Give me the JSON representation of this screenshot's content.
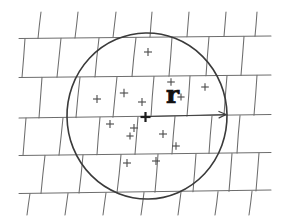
{
  "figure": {
    "canvas": {
      "width": 287,
      "height": 217,
      "background": "#ffffff"
    },
    "style": {
      "wall_stroke": "#6d6d6d",
      "wall_stroke_width": 1.05,
      "circle_stroke": "#3a3a3a",
      "circle_stroke_width": 1.6,
      "arrow_stroke": "#3f3f3f",
      "arrow_stroke_width": 1.2,
      "mark_stroke": "#4a4a4a",
      "mark_stroke_width": 1.1,
      "center_stroke": "#1c1c1c",
      "center_stroke_width": 2.2,
      "label_color": "#111111"
    },
    "radius_label": {
      "text": "r",
      "x": 166,
      "y": 103,
      "font_size": 25
    },
    "circle": {
      "cx": 147,
      "cy": 116,
      "rx": 80,
      "ry": 83,
      "rotation": -1
    },
    "center_point": {
      "x": 145.5,
      "y": 117,
      "arm": 5
    },
    "radius_arrow": {
      "x1": 150,
      "y1": 116.5,
      "x2": 226,
      "y2": 114.5,
      "head_length": 7,
      "head_spread": 3.2
    },
    "wall": {
      "left": 19,
      "right": 271,
      "courses": [
        {
          "y_left": 38.5,
          "y_right": 36.0
        },
        {
          "y_left": 77.5,
          "y_right": 75.0
        },
        {
          "y_left": 118.0,
          "y_right": 114.5
        },
        {
          "y_left": 155.5,
          "y_right": 152.5
        },
        {
          "y_left": 193.5,
          "y_right": 190.0
        }
      ],
      "top_stub_y": 12,
      "bottom_stub_y": 215,
      "joints": [
        {
          "row": 0,
          "x_top": 41,
          "x_bot": 38,
          "top": 12,
          "bottom": 38.5
        },
        {
          "row": 0,
          "x_top": 78,
          "x_bot": 75,
          "top": 12,
          "bottom": 38.0
        },
        {
          "row": 0,
          "x_top": 116,
          "x_bot": 113,
          "top": 12,
          "bottom": 37.5
        },
        {
          "row": 0,
          "x_top": 152,
          "x_bot": 150,
          "top": 12,
          "bottom": 37.0
        },
        {
          "row": 0,
          "x_top": 189,
          "x_bot": 187,
          "top": 12,
          "bottom": 36.8
        },
        {
          "row": 0,
          "x_top": 226,
          "x_bot": 224,
          "top": 12,
          "bottom": 36.4
        },
        {
          "row": 0,
          "x_top": 257,
          "x_bot": 255,
          "top": 12,
          "bottom": 36.2
        },
        {
          "row": 1,
          "x_top": 25,
          "x_bot": 22,
          "top": 38.5,
          "bottom": 77.5
        },
        {
          "row": 1,
          "x_top": 61,
          "x_bot": 57,
          "top": 38.3,
          "bottom": 77.3
        },
        {
          "row": 1,
          "x_top": 99,
          "x_bot": 95,
          "top": 38.0,
          "bottom": 77.0
        },
        {
          "row": 1,
          "x_top": 136,
          "x_bot": 132,
          "top": 37.6,
          "bottom": 76.6
        },
        {
          "row": 1,
          "x_top": 172,
          "x_bot": 169,
          "top": 37.2,
          "bottom": 76.2
        },
        {
          "row": 1,
          "x_top": 209,
          "x_bot": 206,
          "top": 36.8,
          "bottom": 75.8
        },
        {
          "row": 1,
          "x_top": 244,
          "x_bot": 241,
          "top": 36.4,
          "bottom": 75.4
        },
        {
          "row": 2,
          "x_top": 42,
          "x_bot": 39,
          "top": 77.4,
          "bottom": 118.0
        },
        {
          "row": 2,
          "x_top": 80,
          "x_bot": 76,
          "top": 77.2,
          "bottom": 117.6
        },
        {
          "row": 2,
          "x_top": 117,
          "x_bot": 113,
          "top": 76.8,
          "bottom": 117.2
        },
        {
          "row": 2,
          "x_top": 154,
          "x_bot": 151,
          "top": 76.4,
          "bottom": 116.8
        },
        {
          "row": 2,
          "x_top": 190,
          "x_bot": 187,
          "top": 76.0,
          "bottom": 116.2
        },
        {
          "row": 2,
          "x_top": 227,
          "x_bot": 224,
          "top": 75.6,
          "bottom": 115.6
        },
        {
          "row": 2,
          "x_top": 257,
          "x_bot": 254,
          "top": 75.2,
          "bottom": 115.2
        },
        {
          "row": 3,
          "x_top": 26,
          "x_bot": 23,
          "top": 118.0,
          "bottom": 155.5
        },
        {
          "row": 3,
          "x_top": 63,
          "x_bot": 59,
          "top": 117.7,
          "bottom": 155.2
        },
        {
          "row": 3,
          "x_top": 100,
          "x_bot": 97,
          "top": 117.3,
          "bottom": 154.8
        },
        {
          "row": 3,
          "x_top": 138,
          "x_bot": 135,
          "top": 116.9,
          "bottom": 154.4
        },
        {
          "row": 3,
          "x_top": 175,
          "x_bot": 172,
          "top": 116.4,
          "bottom": 154.0
        },
        {
          "row": 3,
          "x_top": 212,
          "x_bot": 209,
          "top": 116.0,
          "bottom": 153.5
        },
        {
          "row": 3,
          "x_top": 240,
          "x_bot": 237,
          "top": 115.6,
          "bottom": 153.1
        },
        {
          "row": 4,
          "x_top": 45,
          "x_bot": 41,
          "top": 155.4,
          "bottom": 193.5
        },
        {
          "row": 4,
          "x_top": 83,
          "x_bot": 79,
          "top": 155.0,
          "bottom": 193.1
        },
        {
          "row": 4,
          "x_top": 121,
          "x_bot": 117,
          "top": 154.6,
          "bottom": 192.7
        },
        {
          "row": 4,
          "x_top": 158,
          "x_bot": 155,
          "top": 154.2,
          "bottom": 192.3
        },
        {
          "row": 4,
          "x_top": 196,
          "x_bot": 193,
          "top": 153.8,
          "bottom": 191.8
        },
        {
          "row": 4,
          "x_top": 232,
          "x_bot": 229,
          "top": 153.4,
          "bottom": 191.4
        },
        {
          "row": 4,
          "x_top": 259,
          "x_bot": 256,
          "top": 153.0,
          "bottom": 191.0
        },
        {
          "row": 5,
          "x_top": 30,
          "x_bot": 27,
          "top": 193.5,
          "bottom": 215
        },
        {
          "row": 5,
          "x_top": 68,
          "x_bot": 65,
          "top": 193.2,
          "bottom": 215
        },
        {
          "row": 5,
          "x_top": 106,
          "x_bot": 103,
          "top": 192.8,
          "bottom": 215
        },
        {
          "row": 5,
          "x_top": 144,
          "x_bot": 141,
          "top": 192.4,
          "bottom": 215
        },
        {
          "row": 5,
          "x_top": 181,
          "x_bot": 178,
          "top": 192.0,
          "bottom": 215
        },
        {
          "row": 5,
          "x_top": 218,
          "x_bot": 215,
          "top": 191.6,
          "bottom": 215
        },
        {
          "row": 5,
          "x_top": 252,
          "x_bot": 249,
          "top": 191.2,
          "bottom": 215
        }
      ]
    },
    "point_marks": [
      {
        "x": 148,
        "y": 52,
        "size": 4.0
      },
      {
        "x": 171,
        "y": 82,
        "size": 3.8
      },
      {
        "x": 205,
        "y": 87,
        "size": 3.8
      },
      {
        "x": 97,
        "y": 99,
        "size": 4.0
      },
      {
        "x": 124,
        "y": 93,
        "size": 4.2
      },
      {
        "x": 142,
        "y": 102,
        "size": 4.0
      },
      {
        "x": 181,
        "y": 97,
        "size": 3.6
      },
      {
        "x": 110,
        "y": 124,
        "size": 4.0
      },
      {
        "x": 134,
        "y": 128,
        "size": 4.0
      },
      {
        "x": 130,
        "y": 136,
        "size": 3.6
      },
      {
        "x": 163,
        "y": 134,
        "size": 4.0
      },
      {
        "x": 176,
        "y": 146,
        "size": 3.8
      },
      {
        "x": 127,
        "y": 163,
        "size": 4.0
      },
      {
        "x": 156,
        "y": 161,
        "size": 4.0
      }
    ]
  }
}
